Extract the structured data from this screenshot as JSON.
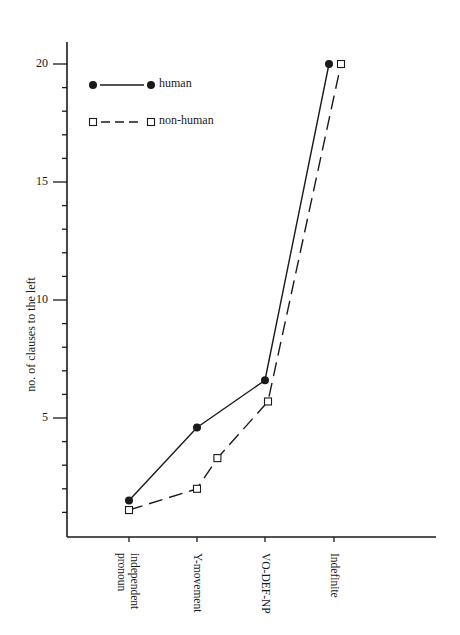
{
  "chart_data": {
    "type": "line",
    "title": "",
    "xlabel": "",
    "ylabel": "no. of clauses to the left",
    "ylim": [
      0,
      21
    ],
    "y_ticks_major": [
      5,
      10,
      15,
      20
    ],
    "y_ticks_minor_step": 1,
    "grid": false,
    "legend_position": "upper-left",
    "categories": [
      "independent pronoun",
      "Y-movement",
      "VO-DEF-NP",
      "Indefinite"
    ],
    "category_lines": [
      [
        "independent",
        "pronoun"
      ],
      [
        "Y-movement"
      ],
      [
        "VO-DEF-NP"
      ],
      [
        "Indefinite"
      ]
    ],
    "series": [
      {
        "name": "human",
        "marker": "filled-circle",
        "line_style": "solid",
        "values": [
          1.5,
          4.6,
          6.6,
          20
        ]
      },
      {
        "name": "non-human",
        "marker": "open-square",
        "line_style": "dashed",
        "values": [
          1.1,
          2.0,
          5.7,
          20
        ],
        "extra_points": [
          {
            "between": [
              "Y-movement",
              "VO-DEF-NP"
            ],
            "x_fraction": 0.3,
            "value": 3.3
          }
        ]
      }
    ],
    "colors": {
      "ink": "#1a1a1a",
      "background": "#ffffff"
    }
  }
}
